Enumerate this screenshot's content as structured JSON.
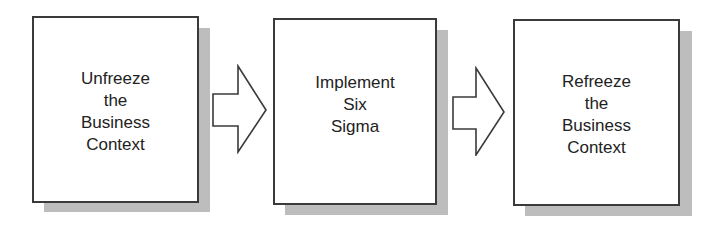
{
  "diagram": {
    "type": "process-flow",
    "colors": {
      "box_border": "#3a3a3a",
      "box_fill": "#ffffff",
      "shadow": "#bdbdbd",
      "text": "#222222",
      "arrow_stroke": "#3a3a3a"
    },
    "steps": [
      {
        "label": "Unfreeze\nthe\nBusiness\nContext"
      },
      {
        "label": "Implement\nSix\nSigma"
      },
      {
        "label": "Refreeze\nthe\nBusiness\nContext"
      }
    ],
    "connectors": [
      {
        "from": 0,
        "to": 1,
        "shape": "block-arrow-right"
      },
      {
        "from": 1,
        "to": 2,
        "shape": "block-arrow-right"
      }
    ]
  }
}
